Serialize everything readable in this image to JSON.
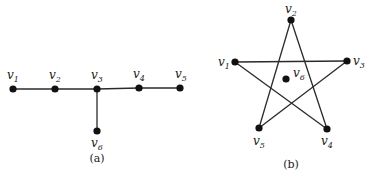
{
  "graph_a": {
    "caption": "(a)",
    "nodes": [
      {
        "id": "v1",
        "base": "v",
        "sub": "1",
        "x": 13,
        "y": 89,
        "lx": 7,
        "ly": 79
      },
      {
        "id": "v2",
        "base": "v",
        "sub": "2",
        "x": 55,
        "y": 89,
        "lx": 49,
        "ly": 79
      },
      {
        "id": "v3",
        "base": "v",
        "sub": "3",
        "x": 97,
        "y": 89,
        "lx": 91,
        "ly": 79
      },
      {
        "id": "v4",
        "base": "v",
        "sub": "4",
        "x": 139,
        "y": 88,
        "lx": 133,
        "ly": 78
      },
      {
        "id": "v5",
        "base": "v",
        "sub": "5",
        "x": 180,
        "y": 88,
        "lx": 175,
        "ly": 78
      },
      {
        "id": "v6",
        "base": "v",
        "sub": "6",
        "x": 97,
        "y": 131,
        "lx": 91,
        "ly": 147
      }
    ],
    "edges": [
      [
        "v1",
        "v2"
      ],
      [
        "v2",
        "v3"
      ],
      [
        "v3",
        "v4"
      ],
      [
        "v4",
        "v5"
      ],
      [
        "v3",
        "v6"
      ]
    ]
  },
  "graph_b": {
    "caption": "(b)",
    "nodes": [
      {
        "id": "v1",
        "base": "v",
        "sub": "1",
        "x": 235,
        "y": 62,
        "lx": 218,
        "ly": 66
      },
      {
        "id": "v2",
        "base": "v",
        "sub": "2",
        "x": 291,
        "y": 20,
        "lx": 285,
        "ly": 13
      },
      {
        "id": "v3",
        "base": "v",
        "sub": "3",
        "x": 347,
        "y": 61,
        "lx": 353,
        "ly": 65
      },
      {
        "id": "v4",
        "base": "v",
        "sub": "4",
        "x": 327,
        "y": 129,
        "lx": 321,
        "ly": 145
      },
      {
        "id": "v5",
        "base": "v",
        "sub": "5",
        "x": 259,
        "y": 128,
        "lx": 253,
        "ly": 145
      },
      {
        "id": "v6",
        "base": "v",
        "sub": "6",
        "x": 286,
        "y": 79,
        "lx": 293,
        "ly": 77
      }
    ],
    "edges": [
      [
        "v1",
        "v3"
      ],
      [
        "v1",
        "v4"
      ],
      [
        "v2",
        "v4"
      ],
      [
        "v2",
        "v5"
      ],
      [
        "v3",
        "v5"
      ]
    ]
  }
}
